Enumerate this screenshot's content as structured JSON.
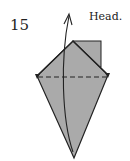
{
  "diagram": {
    "step_number": "15",
    "caption": "Head.",
    "colors": {
      "paper_fill": "#aaaaaa",
      "outline": "#222222",
      "background": "#ffffff"
    },
    "elements": [
      {
        "type": "kite-shape",
        "description": "gray folded paper kite shape"
      },
      {
        "type": "square-flap",
        "description": "gray rectangular flap at top right"
      },
      {
        "type": "valley-fold-line",
        "style": "dashed",
        "description": "horizontal dashed fold line across widest part"
      },
      {
        "type": "arrow",
        "description": "curved arrow from bottom point to top indicating fold up"
      }
    ]
  }
}
